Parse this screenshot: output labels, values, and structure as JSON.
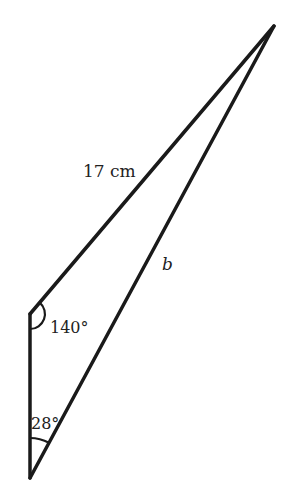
{
  "diagram": {
    "type": "triangle",
    "stroke_color": "#1a1a1a",
    "background": "#ffffff",
    "vertices": {
      "apex": [
        274,
        26
      ],
      "top_left": [
        30,
        314
      ],
      "bottom": [
        30,
        478
      ]
    },
    "labels": {
      "side_top": "17 cm",
      "side_right": "b",
      "angle_top_left": "140°",
      "angle_bottom": "28°"
    }
  }
}
